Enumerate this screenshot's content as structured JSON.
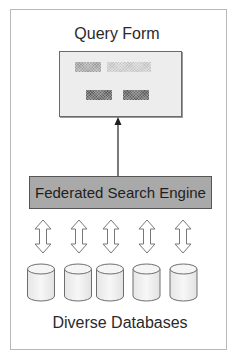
{
  "diagram": {
    "top_label": "Query Form",
    "middle_label": "Federated Search Engine",
    "bottom_label": "Diverse Databases",
    "query_form": {
      "fields": [
        {
          "name": "field-label-block",
          "shade": "mid"
        },
        {
          "name": "field-input-block",
          "shade": "light"
        },
        {
          "name": "button-block-1",
          "shade": "dark"
        },
        {
          "name": "button-block-2",
          "shade": "dark"
        }
      ]
    },
    "connections": {
      "engine_to_form": "single-headed arrow (up)",
      "engine_to_databases": "double-headed arrows (x5)"
    },
    "database_count": 5,
    "colors": {
      "frame_border": "#b8b8b8",
      "query_box_fill": "#ededed",
      "engine_box_fill": "#a9a9a9",
      "engine_box_border": "#555555",
      "text": "#2a2a2a",
      "cylinder_fill": "#f0f0f0",
      "cylinder_stroke": "#6e6e6e"
    }
  }
}
